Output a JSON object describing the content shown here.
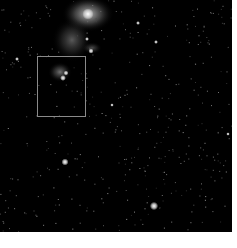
{
  "viewer": {
    "background": "#000000",
    "width": 232,
    "height": 232
  },
  "selection": {
    "x": 37,
    "y": 56,
    "width": 49,
    "height": 61,
    "color": "#8a8a8a"
  },
  "nebulae": [
    {
      "cx": 88,
      "cy": 14,
      "rx": 26,
      "ry": 18,
      "opacity": 0.75
    },
    {
      "cx": 72,
      "cy": 40,
      "rx": 20,
      "ry": 22,
      "opacity": 0.35
    },
    {
      "cx": 60,
      "cy": 72,
      "rx": 12,
      "ry": 10,
      "opacity": 0.45
    },
    {
      "cx": 92,
      "cy": 48,
      "rx": 10,
      "ry": 6,
      "opacity": 0.3
    }
  ],
  "bright_stars": [
    {
      "x": 88,
      "y": 14,
      "r": 3.5
    },
    {
      "x": 65,
      "y": 162,
      "r": 2.2
    },
    {
      "x": 154,
      "y": 206,
      "r": 2.6
    },
    {
      "x": 63,
      "y": 78,
      "r": 1.8
    },
    {
      "x": 66,
      "y": 73,
      "r": 1.5
    },
    {
      "x": 91,
      "y": 51,
      "r": 1.6
    },
    {
      "x": 138,
      "y": 23,
      "r": 1.2
    },
    {
      "x": 156,
      "y": 42,
      "r": 1.2
    },
    {
      "x": 17,
      "y": 59,
      "r": 1.2
    },
    {
      "x": 112,
      "y": 105,
      "r": 1.1
    },
    {
      "x": 228,
      "y": 134,
      "r": 1.1
    },
    {
      "x": 87,
      "y": 39,
      "r": 1.2
    }
  ]
}
